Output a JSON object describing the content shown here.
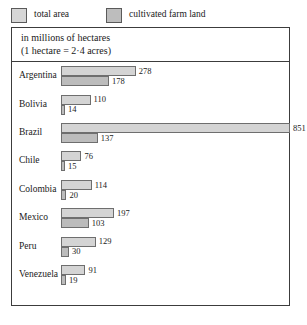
{
  "legend": {
    "items": [
      {
        "label": "total area",
        "key": "total",
        "color": "#d6d6d6"
      },
      {
        "label": "cultivated farm land",
        "key": "farm",
        "color": "#bdbdbd"
      }
    ]
  },
  "title": {
    "line1": "in millions of hectares",
    "line2": "(1 hectare = 2·4 acres)"
  },
  "chart_data": {
    "type": "bar",
    "orientation": "horizontal",
    "title": "in millions of hectares",
    "subtitle": "(1 hectare = 2·4 acres)",
    "xlabel": "millions of hectares",
    "ylabel": "",
    "grid": false,
    "legend_position": "top-left",
    "xlim": [
      0,
      851
    ],
    "categories": [
      "Argentina",
      "Bolivia",
      "Brazil",
      "Chile",
      "Colombia",
      "Mexico",
      "Peru",
      "Venezuela"
    ],
    "series": [
      {
        "name": "total area",
        "values": [
          278,
          110,
          851,
          76,
          114,
          197,
          129,
          91
        ]
      },
      {
        "name": "cultivated farm land",
        "values": [
          178,
          14,
          137,
          15,
          20,
          103,
          30,
          19
        ]
      }
    ],
    "rows": [
      {
        "country": "Argentina",
        "total": 278,
        "farm": 178
      },
      {
        "country": "Bolivia",
        "total": 110,
        "farm": 14
      },
      {
        "country": "Brazil",
        "total": 851,
        "farm": 137
      },
      {
        "country": "Chile",
        "total": 76,
        "farm": 15
      },
      {
        "country": "Colombia",
        "total": 114,
        "farm": 20
      },
      {
        "country": "Mexico",
        "total": 197,
        "farm": 103
      },
      {
        "country": "Peru",
        "total": 129,
        "farm": 30
      },
      {
        "country": "Venezuela",
        "total": 91,
        "farm": 19
      }
    ]
  }
}
